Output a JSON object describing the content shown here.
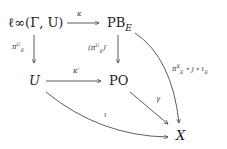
{
  "diagram": {
    "type": "commutative-diagram",
    "nodes": {
      "linf": "ℓ∞(Γ, U)",
      "pb": "PB",
      "pb_sub": "E",
      "u": "U",
      "po": "PO",
      "x": "X"
    },
    "arrows": {
      "kappa": "κ",
      "kappa_prime": "κ′",
      "pi_base": "π",
      "pi_sup": "U",
      "pi_sub": "E",
      "pi_prime_open": "(π",
      "pi_prime_close": ")′",
      "gamma": "γ",
      "iota": "ι",
      "comp_pi": "π",
      "comp_sup": "X",
      "comp_sub": "E",
      "comp_rest": "∘ ȷ ∘ ι",
      "comp_rest_sub": "E"
    }
  }
}
